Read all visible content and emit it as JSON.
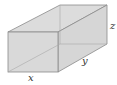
{
  "diagram": {
    "type": "rectangular-prism",
    "labels": {
      "x": "x",
      "y": "y",
      "z": "z"
    },
    "colors": {
      "face_fill": "#d9d9d9",
      "edge": "#8a8a8a",
      "hidden_edge": "#a8a8a8",
      "background": "#ffffff"
    }
  }
}
